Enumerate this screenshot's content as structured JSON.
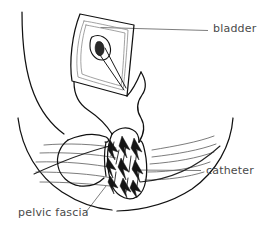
{
  "figure": {
    "type": "anatomical-line-drawing",
    "width": 265,
    "height": 235,
    "background_color": "#ffffff",
    "line_color": "#111111",
    "label_color": "#4a4a4a",
    "leader_color": "#6e6e6e"
  },
  "labels": [
    {
      "id": "bladder",
      "text": "bladder",
      "text_x": 213,
      "text_y": 32,
      "anchor": "start",
      "leader": "M 100.5 27.5 L 208 30.5",
      "leader_style": "horizontal"
    },
    {
      "id": "catheter",
      "text": "catheter",
      "text_x": 206,
      "text_y": 174,
      "anchor": "start",
      "leader": "M 132 170 L 201 170.5",
      "leader_style": "horizontal"
    },
    {
      "id": "pelvic-fascia",
      "text": "pelvic fascia",
      "text_x": 18,
      "text_y": 216,
      "anchor": "start",
      "leader": "M 86 212 L 106 186",
      "leader_style": "diagonal"
    }
  ],
  "structures": [
    {
      "id": "left-body-contour",
      "name": "left outer body contour"
    },
    {
      "id": "right-body-contour",
      "name": "right outer body contour"
    },
    {
      "id": "bladder-opening",
      "name": "opened bladder dome window"
    },
    {
      "id": "bladder-inner-margin",
      "name": "bladder inner cut margin"
    },
    {
      "id": "balloon",
      "name": "catheter balloon in bladder"
    },
    {
      "id": "urethra",
      "name": "urethral / prostatic stump"
    },
    {
      "id": "pelvic-fascia-lines",
      "name": "pelvic fascia striations"
    },
    {
      "id": "suture-loop",
      "name": "suture / catheter loop"
    },
    {
      "id": "shaded-mass",
      "name": "shaded divided tissue"
    }
  ]
}
